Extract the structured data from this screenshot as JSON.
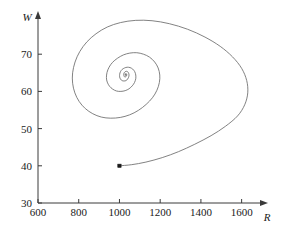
{
  "figure": {
    "name": "phase-plane-spiral-plot",
    "background_color": "#ffffff",
    "curve_color": "#6b6b6b",
    "axis_color": "#3a3a3a",
    "text_color": "#1a1a1a"
  },
  "chart_data": {
    "type": "line",
    "title": "",
    "subtitle": "",
    "xlabel": "R",
    "ylabel": "W",
    "xlim": [
      600,
      1700
    ],
    "ylim": [
      30,
      80
    ],
    "xticks": [
      600,
      800,
      1000,
      1200,
      1400,
      1600
    ],
    "xticklabels": [
      "600",
      "800",
      "1000",
      "1200",
      "1400",
      "1600"
    ],
    "yticks": [
      30,
      40,
      50,
      60,
      70
    ],
    "yticklabels": [
      "30",
      "40",
      "50",
      "60",
      "70"
    ],
    "grid": false,
    "legend": null,
    "legend_position": "none",
    "annotations": [
      {
        "name": "initial-condition-marker",
        "label": "",
        "x": 1000,
        "y": 40,
        "marker": "filled-square-dot"
      }
    ],
    "axis_arrows": {
      "x_axis_arrow": true,
      "y_axis_arrow": true
    },
    "series": [
      {
        "name": "trajectory",
        "description": "inward spiral trajectory",
        "equilibrium": [
          1050,
          64
        ],
        "start": [
          1000,
          40
        ],
        "points": [
          [
            1000,
            40.0
          ],
          [
            1060,
            40.3
          ],
          [
            1130,
            41.0
          ],
          [
            1210,
            42.2
          ],
          [
            1290,
            43.8
          ],
          [
            1370,
            45.8
          ],
          [
            1450,
            48.1
          ],
          [
            1520,
            50.6
          ],
          [
            1580,
            53.4
          ],
          [
            1615,
            56.4
          ],
          [
            1630,
            59.6
          ],
          [
            1625,
            62.9
          ],
          [
            1600,
            66.2
          ],
          [
            1555,
            69.3
          ],
          [
            1495,
            72.1
          ],
          [
            1420,
            74.6
          ],
          [
            1335,
            76.7
          ],
          [
            1245,
            78.2
          ],
          [
            1160,
            79.0
          ],
          [
            1080,
            79.1
          ],
          [
            1005,
            78.5
          ],
          [
            940,
            77.3
          ],
          [
            885,
            75.5
          ],
          [
            840,
            73.3
          ],
          [
            805,
            70.7
          ],
          [
            782,
            67.9
          ],
          [
            770,
            65.0
          ],
          [
            770,
            62.2
          ],
          [
            781,
            59.6
          ],
          [
            802,
            57.3
          ],
          [
            832,
            55.4
          ],
          [
            869,
            54.0
          ],
          [
            911,
            53.1
          ],
          [
            957,
            52.8
          ],
          [
            1004,
            53.0
          ],
          [
            1050,
            53.7
          ],
          [
            1093,
            54.9
          ],
          [
            1131,
            56.5
          ],
          [
            1162,
            58.3
          ],
          [
            1184,
            60.3
          ],
          [
            1196,
            62.4
          ],
          [
            1198,
            64.4
          ],
          [
            1190,
            66.3
          ],
          [
            1173,
            67.9
          ],
          [
            1148,
            69.2
          ],
          [
            1118,
            70.0
          ],
          [
            1085,
            70.4
          ],
          [
            1051,
            70.3
          ],
          [
            1019,
            69.8
          ],
          [
            990,
            68.9
          ],
          [
            966,
            67.8
          ],
          [
            949,
            66.5
          ],
          [
            939,
            65.1
          ],
          [
            936,
            63.7
          ],
          [
            940,
            62.5
          ],
          [
            951,
            61.4
          ],
          [
            967,
            60.6
          ],
          [
            986,
            60.1
          ],
          [
            1007,
            60.0
          ],
          [
            1028,
            60.2
          ],
          [
            1047,
            60.7
          ],
          [
            1063,
            61.5
          ],
          [
            1074,
            62.4
          ],
          [
            1080,
            63.4
          ],
          [
            1080,
            64.4
          ],
          [
            1075,
            65.3
          ],
          [
            1065,
            66.0
          ],
          [
            1052,
            66.4
          ],
          [
            1038,
            66.5
          ],
          [
            1025,
            66.3
          ],
          [
            1013,
            65.9
          ],
          [
            1005,
            65.3
          ],
          [
            1001,
            64.6
          ],
          [
            1001,
            63.9
          ],
          [
            1005,
            63.3
          ],
          [
            1013,
            62.9
          ],
          [
            1022,
            62.8
          ],
          [
            1032,
            62.9
          ],
          [
            1040,
            63.3
          ],
          [
            1045,
            63.8
          ],
          [
            1047,
            64.4
          ],
          [
            1045,
            64.9
          ],
          [
            1040,
            65.3
          ],
          [
            1034,
            65.4
          ],
          [
            1028,
            65.3
          ],
          [
            1023,
            65.0
          ],
          [
            1021,
            64.6
          ],
          [
            1022,
            64.2
          ],
          [
            1025,
            63.9
          ],
          [
            1030,
            63.9
          ],
          [
            1034,
            64.1
          ],
          [
            1036,
            64.4
          ],
          [
            1035,
            64.7
          ],
          [
            1032,
            64.8
          ],
          [
            1029,
            64.7
          ],
          [
            1028,
            64.5
          ],
          [
            1029,
            64.3
          ],
          [
            1031,
            64.3
          ],
          [
            1033,
            64.4
          ],
          [
            1032,
            64.6
          ],
          [
            1030,
            64.6
          ],
          [
            1030,
            64.5
          ]
        ]
      }
    ]
  }
}
